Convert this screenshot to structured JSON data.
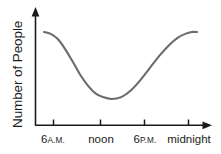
{
  "chart_data": {
    "type": "line",
    "title": "",
    "xlabel": "",
    "ylabel": "Number of People",
    "grid": false,
    "legend": null,
    "axis_style": "arrowed",
    "curve_color": "#6b6b6b",
    "axis_color": "#1b1b1b",
    "xlim": [
      "6 A.M.",
      "midnight"
    ],
    "ylim": [
      0,
      1
    ],
    "x_ticks": [
      {
        "num": "6",
        "suffix": "A.M.",
        "label": "6 A.M."
      },
      {
        "num": "",
        "suffix": "",
        "label": "noon"
      },
      {
        "num": "6",
        "suffix": "P.M.",
        "label": "6 P.M."
      },
      {
        "num": "",
        "suffix": "",
        "label": "midnight"
      }
    ],
    "x": [
      4.4,
      5.3,
      6.2,
      7.1,
      8.2,
      9.3,
      10.4,
      11.4,
      12.4,
      13.6,
      14.9,
      16.2,
      17.5,
      18.8,
      20.1,
      21.4,
      22.6,
      23.6,
      24.5,
      25.2
    ],
    "values": [
      0.93,
      0.91,
      0.86,
      0.77,
      0.63,
      0.48,
      0.36,
      0.28,
      0.24,
      0.22,
      0.24,
      0.31,
      0.42,
      0.55,
      0.68,
      0.79,
      0.87,
      0.91,
      0.93,
      0.93
    ]
  }
}
